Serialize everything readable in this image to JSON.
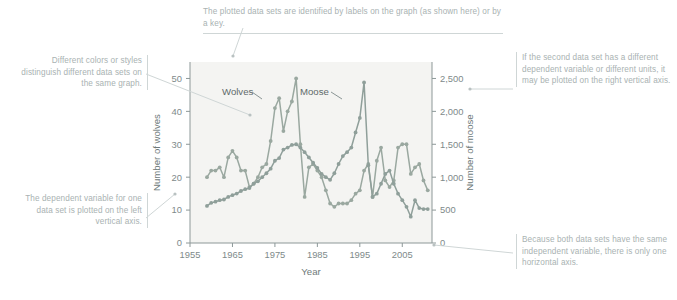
{
  "figure": {
    "background": "#ffffff",
    "plot_background": "#f4f4f2",
    "annotation_color": "#a9b2b2",
    "axis_color": "#8d9898"
  },
  "annotations": {
    "top": "The plotted data sets are identified by labels on the graph (as shown here) or by a key.",
    "left_top": "Different colors or styles distinguish different data sets on the same graph.",
    "left_bottom": "The dependent variable for one data set is plotted on the left vertical axis.",
    "right_top": "If the second data set has a different dependent variable or different units, it may be plotted on the right vertical axis.",
    "right_bottom": "Because both data sets have the same independent variable, there is only one horizontal axis."
  },
  "chart_data": {
    "type": "line",
    "title": "",
    "xlabel": "Year",
    "ylabel": "Number of wolves",
    "y2label": "Number of moose",
    "xlim": [
      1955,
      2012
    ],
    "ylim": [
      0,
      55
    ],
    "y2lim": [
      0,
      2750
    ],
    "grid": false,
    "legend": "inline-labels",
    "xticks": [
      "1955",
      "1965",
      "1975",
      "1985",
      "1995",
      "2005"
    ],
    "xtick_values": [
      1955,
      1965,
      1975,
      1985,
      1995,
      2005
    ],
    "yticks": [
      "0",
      "10",
      "20",
      "30",
      "40",
      "50"
    ],
    "ytick_values": [
      0,
      10,
      20,
      30,
      40,
      50
    ],
    "y2ticks": [
      "0",
      "500",
      "1,000",
      "1,500",
      "2,000",
      "2,500"
    ],
    "y2tick_values": [
      0,
      500,
      1000,
      1500,
      2000,
      2500
    ],
    "series": [
      {
        "name": "Wolves",
        "axis": "left",
        "color": "#9aa8a0",
        "label_x": 1968,
        "x": [
          1959,
          1960,
          1961,
          1962,
          1963,
          1964,
          1965,
          1966,
          1967,
          1968,
          1969,
          1970,
          1971,
          1972,
          1973,
          1974,
          1975,
          1976,
          1977,
          1978,
          1979,
          1980,
          1981,
          1982,
          1983,
          1984,
          1985,
          1986,
          1987,
          1988,
          1989,
          1990,
          1991,
          1992,
          1993,
          1994,
          1995,
          1996,
          1997,
          1998,
          1999,
          2000,
          2001,
          2002,
          2003,
          2004,
          2005,
          2006,
          2007,
          2008,
          2009,
          2010,
          2011
        ],
        "values": [
          20,
          22,
          22,
          23,
          20,
          26,
          28,
          26,
          22,
          22,
          17,
          18,
          20,
          23,
          24,
          31,
          41,
          44,
          34,
          40,
          43,
          50,
          30,
          14,
          23,
          24,
          22,
          20,
          16,
          12,
          11,
          12,
          12,
          12,
          13,
          15,
          16,
          22,
          24,
          14,
          25,
          29,
          19,
          17,
          19,
          29,
          30,
          30,
          21,
          23,
          24,
          19,
          16
        ]
      },
      {
        "name": "Moose",
        "axis": "right",
        "color": "#8f9f9a",
        "label_x": 1989,
        "x": [
          1959,
          1960,
          1961,
          1962,
          1963,
          1964,
          1965,
          1966,
          1967,
          1968,
          1969,
          1970,
          1971,
          1972,
          1973,
          1974,
          1975,
          1976,
          1977,
          1978,
          1979,
          1980,
          1981,
          1982,
          1983,
          1984,
          1985,
          1986,
          1987,
          1988,
          1989,
          1990,
          1991,
          1992,
          1993,
          1994,
          1995,
          1996,
          1997,
          1998,
          1999,
          2000,
          2001,
          2002,
          2003,
          2004,
          2005,
          2006,
          2007,
          2008,
          2009,
          2010,
          2011
        ],
        "values": [
          563,
          610,
          628,
          650,
          661,
          700,
          727,
          751,
          790,
          818,
          836,
          903,
          937,
          1000,
          1060,
          1130,
          1250,
          1290,
          1420,
          1450,
          1490,
          1500,
          1450,
          1380,
          1300,
          1220,
          1140,
          1050,
          1000,
          960,
          1060,
          1200,
          1320,
          1380,
          1450,
          1680,
          1900,
          2440,
          1180,
          700,
          750,
          900,
          1050,
          1100,
          900,
          750,
          650,
          550,
          400,
          650,
          530,
          515,
          515
        ]
      }
    ]
  }
}
